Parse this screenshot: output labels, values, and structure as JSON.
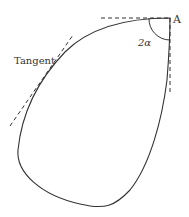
{
  "diagram": {
    "type": "geometric-figure",
    "labels": {
      "point": "A",
      "angle": "2α",
      "tangent": "Tangent"
    },
    "colors": {
      "stroke": "#333333",
      "background": "#ffffff"
    }
  }
}
